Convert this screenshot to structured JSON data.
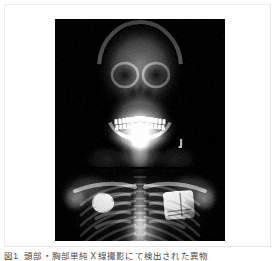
{
  "figure": {
    "image_alt": "Frontal radiograph of head, neck and chest",
    "plate_background": "#000000",
    "card_background": "#ffffff",
    "card_border_color": "#e6e6e6"
  },
  "caption": {
    "label": "図1",
    "text": "頭部・胸部単純Ｘ線撮影にて検出された異物"
  },
  "xray_content": {
    "regions": [
      "skull",
      "facial bones",
      "mandible with dentition",
      "cervical soft tissue / neck",
      "clavicles",
      "shoulder girdle",
      "thoracic spine",
      "ribs",
      "lung fields",
      "cardiac silhouette",
      "diaphragm"
    ],
    "findings": [
      "radiopaque square device over left upper thorax",
      "radiopaque rounded opacity over right upper thorax",
      "bright dentition in mandible and maxilla"
    ]
  }
}
